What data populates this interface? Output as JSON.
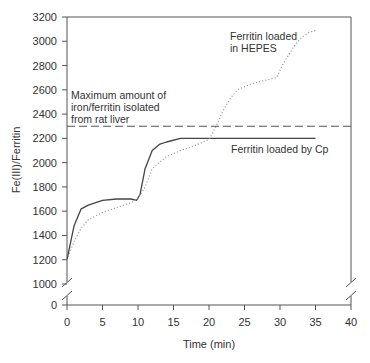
{
  "chart_data": {
    "type": "line",
    "title": "",
    "xlabel": "Time (min)",
    "ylabel": "Fe(III)/Ferritin",
    "xlim": [
      0,
      40
    ],
    "ylim": [
      0,
      3200
    ],
    "y_axis_break": [
      0,
      1000
    ],
    "x_ticks": [
      0,
      5,
      10,
      15,
      20,
      25,
      30,
      35,
      40
    ],
    "y_ticks": [
      0,
      1000,
      1200,
      1400,
      1600,
      1800,
      2000,
      2200,
      2400,
      2600,
      2800,
      3000,
      3200
    ],
    "grid": false,
    "legend": "none (inline annotations)",
    "series": [
      {
        "name": "Ferritin loaded by Cp",
        "style": "solid",
        "color": "#444444",
        "x": [
          0,
          1,
          2,
          3,
          5,
          7,
          9,
          9.8,
          10.3,
          11,
          12,
          13,
          14,
          16,
          20,
          25,
          30,
          35
        ],
        "values": [
          1200,
          1480,
          1620,
          1650,
          1690,
          1700,
          1700,
          1690,
          1740,
          1950,
          2100,
          2150,
          2170,
          2200,
          2200,
          2200,
          2200,
          2200
        ]
      },
      {
        "name": "Ferritin loaded in HEPES",
        "style": "dotted",
        "color": "#999999",
        "x": [
          0,
          1,
          2,
          3,
          5,
          7,
          9,
          10,
          11,
          12,
          14,
          16,
          18,
          20,
          21,
          22,
          23,
          24,
          26,
          28,
          29.5,
          30.5,
          32,
          33,
          34,
          35
        ],
        "values": [
          1200,
          1350,
          1460,
          1530,
          1590,
          1630,
          1670,
          1700,
          1800,
          1950,
          2050,
          2100,
          2140,
          2190,
          2300,
          2430,
          2530,
          2600,
          2650,
          2680,
          2700,
          2820,
          2960,
          3030,
          3070,
          3090
        ]
      },
      {
        "name": "Maximum amount of iron/ferritin isolated from rat liver",
        "style": "dashed",
        "color": "#555555",
        "x": [
          0,
          40
        ],
        "values": [
          2300,
          2300
        ]
      }
    ],
    "annotations": [
      {
        "text_lines": [
          "Ferritin loaded",
          "in HEPES"
        ],
        "near": "dotted curve top"
      },
      {
        "text_lines": [
          "Maximum amount of",
          "iron/ferritin isolated",
          "from rat liver"
        ],
        "near": "dashed line left"
      },
      {
        "text_lines": [
          "Ferritin loaded by Cp"
        ],
        "near": "solid curve plateau"
      }
    ]
  },
  "labels": {
    "xlabel": "Time (min)",
    "ylabel": "Fe(III)/Ferritin",
    "hepes_1": "Ferritin loaded",
    "hepes_2": "in HEPES",
    "max_1": "Maximum amount of",
    "max_2": "iron/ferritin isolated",
    "max_3": "from rat liver",
    "cp": "Ferritin loaded by Cp"
  }
}
